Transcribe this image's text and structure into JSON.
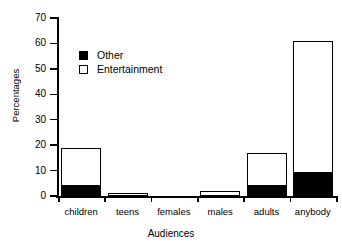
{
  "chart_data": {
    "type": "bar",
    "subtype": "stacked-vertical",
    "title": "",
    "xlabel": "Audiences",
    "ylabel": "Percentages",
    "categories": [
      "children",
      "teens",
      "females",
      "males",
      "adults",
      "anybody"
    ],
    "series": [
      {
        "name": "Other",
        "values": [
          4,
          0,
          0,
          0,
          4,
          9
        ],
        "color": "#000000",
        "fill": "solid"
      },
      {
        "name": "Entertainment",
        "values": [
          15,
          1,
          0,
          2,
          13,
          52
        ],
        "color": "#ffffff",
        "fill": "hollow"
      }
    ],
    "totals": [
      19,
      1,
      0,
      2,
      17,
      61
    ],
    "ylim": [
      0,
      70
    ],
    "yticks": [
      0,
      10,
      20,
      30,
      40,
      50,
      60,
      70
    ],
    "ytick_labels": [
      "0",
      "10",
      "20",
      "30",
      "40",
      "50",
      "60",
      "70"
    ],
    "grid": false,
    "legend_position": "upper-left-inside",
    "legend_entries": [
      "Other",
      "Entertainment"
    ],
    "axis_color": "#000000",
    "background": "#ffffff"
  }
}
